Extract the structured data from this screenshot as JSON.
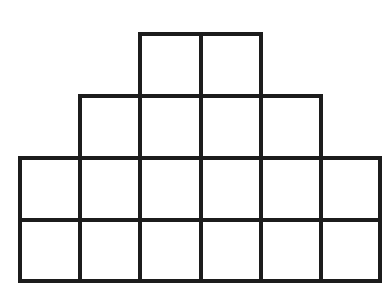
{
  "figure": {
    "background_color": "#ffffff",
    "stroke_color": "#1c1c1c",
    "fill_color": "#ffffff",
    "stroke_width": 4,
    "total_squares": 18,
    "unit_cell": {
      "width": 60,
      "height": 62
    },
    "origin": {
      "x": 20,
      "y": 34
    },
    "columns": 6,
    "rows": 4,
    "column_x": [
      20,
      80,
      140,
      201,
      261,
      321,
      380
    ],
    "row_y": [
      34,
      96,
      158,
      220,
      281
    ],
    "row_labels": [
      "row-1-top",
      "row-2",
      "row-3",
      "row-4-bottom"
    ],
    "row_counts": [
      2,
      4,
      6,
      6
    ],
    "row_column_spans": [
      [
        2,
        3
      ],
      [
        1,
        4
      ],
      [
        0,
        5
      ],
      [
        0,
        5
      ]
    ],
    "squares": [
      {
        "name": "square-r1-c3",
        "row": 1,
        "col": 3,
        "x": 140,
        "y": 34,
        "w": 61,
        "h": 62
      },
      {
        "name": "square-r1-c4",
        "row": 1,
        "col": 4,
        "x": 201,
        "y": 34,
        "w": 60,
        "h": 62
      },
      {
        "name": "square-r2-c2",
        "row": 2,
        "col": 2,
        "x": 80,
        "y": 96,
        "w": 60,
        "h": 62
      },
      {
        "name": "square-r2-c3",
        "row": 2,
        "col": 3,
        "x": 140,
        "y": 96,
        "w": 61,
        "h": 62
      },
      {
        "name": "square-r2-c4",
        "row": 2,
        "col": 4,
        "x": 201,
        "y": 96,
        "w": 60,
        "h": 62
      },
      {
        "name": "square-r2-c5",
        "row": 2,
        "col": 5,
        "x": 261,
        "y": 96,
        "w": 60,
        "h": 62
      },
      {
        "name": "square-r3-c1",
        "row": 3,
        "col": 1,
        "x": 20,
        "y": 158,
        "w": 60,
        "h": 62
      },
      {
        "name": "square-r3-c2",
        "row": 3,
        "col": 2,
        "x": 80,
        "y": 158,
        "w": 60,
        "h": 62
      },
      {
        "name": "square-r3-c3",
        "row": 3,
        "col": 3,
        "x": 140,
        "y": 158,
        "w": 61,
        "h": 62
      },
      {
        "name": "square-r3-c4",
        "row": 3,
        "col": 4,
        "x": 201,
        "y": 158,
        "w": 60,
        "h": 62
      },
      {
        "name": "square-r3-c5",
        "row": 3,
        "col": 5,
        "x": 261,
        "y": 158,
        "w": 60,
        "h": 62
      },
      {
        "name": "square-r3-c6",
        "row": 3,
        "col": 6,
        "x": 321,
        "y": 158,
        "w": 59,
        "h": 62
      },
      {
        "name": "square-r4-c1",
        "row": 4,
        "col": 1,
        "x": 20,
        "y": 220,
        "w": 60,
        "h": 61
      },
      {
        "name": "square-r4-c2",
        "row": 4,
        "col": 2,
        "x": 80,
        "y": 220,
        "w": 60,
        "h": 61
      },
      {
        "name": "square-r4-c3",
        "row": 4,
        "col": 3,
        "x": 140,
        "y": 220,
        "w": 61,
        "h": 61
      },
      {
        "name": "square-r4-c4",
        "row": 4,
        "col": 4,
        "x": 201,
        "y": 220,
        "w": 60,
        "h": 61
      },
      {
        "name": "square-r4-c5",
        "row": 4,
        "col": 5,
        "x": 261,
        "y": 220,
        "w": 60,
        "h": 61
      },
      {
        "name": "square-r4-c6",
        "row": 4,
        "col": 6,
        "x": 321,
        "y": 220,
        "w": 59,
        "h": 61
      }
    ]
  }
}
